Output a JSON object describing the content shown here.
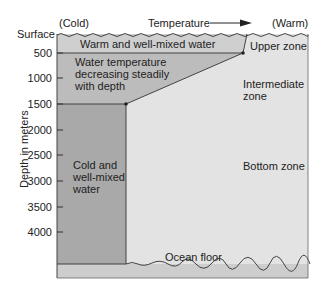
{
  "header": {
    "cold_label": "(Cold)",
    "temperature_label": "Temperature",
    "warm_label": "(Warm)",
    "surface_label": "Surface"
  },
  "axis": {
    "title": "Depth in meters",
    "ticks": [
      {
        "label": "500",
        "y": 53
      },
      {
        "label": "1000",
        "y": 78
      },
      {
        "label": "1500",
        "y": 104
      },
      {
        "label": "2000",
        "y": 130
      },
      {
        "label": "2500",
        "y": 155
      },
      {
        "label": "3000",
        "y": 181
      },
      {
        "label": "3500",
        "y": 207
      },
      {
        "label": "4000",
        "y": 232
      }
    ]
  },
  "regions": {
    "warm_mixed": "Warm and well-mixed water",
    "thermocline_line1": "Water temperature",
    "thermocline_line2": "decreasing steadily",
    "thermocline_line3": "with depth",
    "cold_line1": "Cold and",
    "cold_line2": "well-mixed",
    "cold_line3": "water"
  },
  "zones": {
    "upper": "Upper zone",
    "intermediate_line1": "Intermediate",
    "intermediate_line2": "zone",
    "bottom": "Bottom zone"
  },
  "floor_label": "Ocean floor",
  "colors": {
    "cold_column": "#a9a9a9",
    "thermocline": "#bcbcbc",
    "warm_layer": "#cfcfcf",
    "background_zone": "#e3e3e3",
    "floor": "#cdcdcd",
    "line": "#333333"
  }
}
